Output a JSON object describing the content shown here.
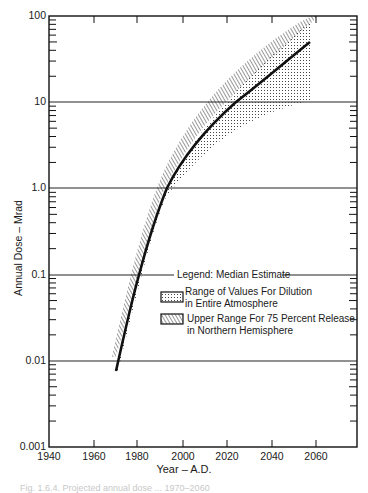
{
  "chart_data": {
    "type": "line",
    "title": "",
    "xlabel": "Year – A.D.",
    "ylabel": "Annual Dose – Mrad",
    "xlim": [
      1940,
      2080
    ],
    "ylim": [
      0.001,
      100
    ],
    "yscale": "log",
    "x_ticks": [
      "1940",
      "1960",
      "1980",
      "2000",
      "2020",
      "2040",
      "2060"
    ],
    "y_ticks": [
      "0.001",
      "0.01",
      "0.1",
      "1.0",
      "10",
      "100"
    ],
    "grid": "horizontal lines at each decade",
    "legend": {
      "title": "Legend:",
      "entries": [
        "Median Estimate",
        "Range of Values For Dilution in Entire Atmosphere",
        "Upper Range For 75 Percent Release in Northern Hemisphere"
      ],
      "position": "center-right"
    },
    "series": [
      {
        "name": "Median Estimate",
        "style": "solid thick line",
        "x": [
          1970,
          1975,
          1981,
          1987,
          1993,
          2000,
          2010,
          2024,
          2040,
          2058
        ],
        "values": [
          0.008,
          0.03,
          0.1,
          0.35,
          1.0,
          2.2,
          4.5,
          10,
          22,
          50
        ]
      },
      {
        "name": "Range of Values For Dilution in Entire Atmosphere",
        "style": "dotted band",
        "x": [
          1970,
          1981,
          1993,
          2000,
          2010,
          2024,
          2040,
          2058
        ],
        "lower": [
          0.008,
          0.1,
          1.0,
          2.0,
          4.0,
          8.0,
          14,
          25
        ],
        "upper": [
          0.009,
          0.12,
          1.2,
          2.8,
          6.0,
          14,
          35,
          90
        ]
      },
      {
        "name": "Upper Range For 75 Percent Release in Northern Hemisphere",
        "style": "hatched band",
        "x": [
          1969,
          1978,
          1990,
          2000,
          2010,
          2020,
          2035,
          2058
        ],
        "lower": [
          0.01,
          0.09,
          1.0,
          2.8,
          6.0,
          12,
          28,
          90
        ],
        "upper": [
          0.012,
          0.12,
          1.3,
          4.0,
          9.0,
          18,
          45,
          100
        ]
      }
    ]
  },
  "axes": {
    "ylabel": "Annual Dose – Mrad",
    "xlabel": "Year – A.D.",
    "y_ticks": [
      "100",
      "10",
      "1.0",
      "0.1",
      "0.01",
      "0.001"
    ],
    "x_ticks": [
      "1940",
      "1960",
      "1980",
      "2000",
      "2020",
      "2040",
      "2060"
    ]
  },
  "legend": {
    "title": "Legend:  Median Estimate",
    "entry1_line1": "Range of Values For Dilution",
    "entry1_line2": "in Entire Atmosphere",
    "entry2_line1": "Upper Range For 75 Percent Release",
    "entry2_line2": "in Northern Hemisphere"
  },
  "caption": "Fig. 1.6.4. Projected annual dose ... 1970–2060"
}
